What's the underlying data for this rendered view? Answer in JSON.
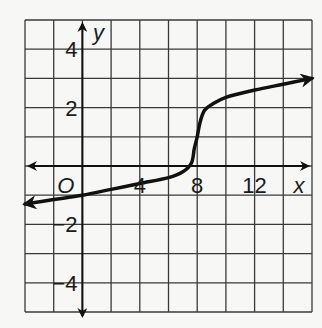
{
  "chart_data": {
    "type": "line",
    "title": "",
    "xlabel": "x",
    "ylabel": "y",
    "origin_label": "O",
    "xlim": [
      -4,
      16
    ],
    "ylim": [
      -5,
      5
    ],
    "grid": true,
    "grid_step_x": 2,
    "grid_step_y": 1,
    "x_ticks": [
      {
        "value": 4,
        "label": "4"
      },
      {
        "value": 8,
        "label": "8"
      },
      {
        "value": 12,
        "label": "12"
      }
    ],
    "y_ticks": [
      {
        "value": 4,
        "label": "4"
      },
      {
        "value": 2,
        "label": "2"
      },
      {
        "value": -2,
        "label": "−2"
      },
      {
        "value": -4,
        "label": "−4"
      }
    ],
    "series": [
      {
        "name": "f(x)",
        "arrows_both_ends": true,
        "x": [
          -4,
          -2,
          0,
          2,
          4,
          6,
          7,
          7.6,
          7.8,
          8,
          8.2,
          8.5,
          9,
          10,
          12,
          14,
          16
        ],
        "y": [
          -1.3,
          -1.15,
          -1.0,
          -0.8,
          -0.6,
          -0.4,
          -0.2,
          0.1,
          0.6,
          1.0,
          1.5,
          1.9,
          2.1,
          2.35,
          2.6,
          2.8,
          3.0
        ]
      }
    ],
    "colors": {
      "grid": "#3a3a3a",
      "axis": "#111111",
      "curve": "#111111",
      "background": "#f7f7f5"
    }
  }
}
